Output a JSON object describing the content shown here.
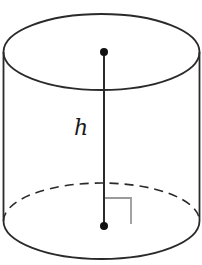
{
  "diagram": {
    "shape": "cylinder",
    "labels": {
      "height": "h"
    },
    "colors": {
      "stroke": "#2a2a2a",
      "right_angle": "#9a9a9a",
      "background": "#ffffff"
    },
    "elements": [
      {
        "type": "ellipse",
        "role": "top-face",
        "style": "solid"
      },
      {
        "type": "line",
        "role": "left-side",
        "style": "solid"
      },
      {
        "type": "line",
        "role": "right-side",
        "style": "solid"
      },
      {
        "type": "arc",
        "role": "bottom-front-edge",
        "style": "solid"
      },
      {
        "type": "arc",
        "role": "bottom-back-edge",
        "style": "dashed"
      },
      {
        "type": "segment",
        "role": "height-axis",
        "style": "solid"
      },
      {
        "type": "point",
        "role": "top-center"
      },
      {
        "type": "point",
        "role": "bottom-center"
      },
      {
        "type": "marker",
        "role": "right-angle"
      }
    ]
  }
}
